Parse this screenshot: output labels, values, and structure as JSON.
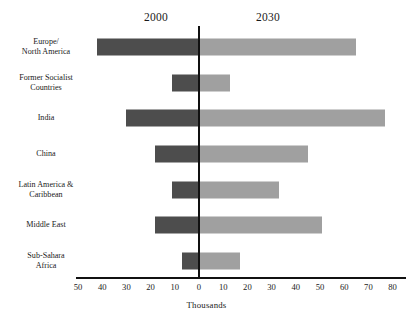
{
  "chart_data": {
    "type": "bar",
    "title": "",
    "subtitle": "",
    "orientation": "horizontal",
    "style": "diverging-back-to-back",
    "categories": [
      "Europe/\nNorth America",
      "Former Socialist\nCountries",
      "India",
      "China",
      "Latin America &\nCaribbean",
      "Middle East",
      "Sub-Sahara\nAfrica"
    ],
    "series": [
      {
        "name": "2000",
        "side": "left",
        "color": "#4d4d4d",
        "values": [
          42,
          11,
          30,
          18,
          11,
          18,
          7
        ]
      },
      {
        "name": "2030",
        "side": "right",
        "color": "#a0a0a0",
        "values": [
          65,
          13,
          77,
          45,
          33,
          51,
          17
        ]
      }
    ],
    "xlabel": "Thousands",
    "ylabel": "",
    "left_axis_max": 50,
    "right_axis_max": 80,
    "xticks_left": [
      50,
      40,
      30,
      20,
      10
    ],
    "xticks_zero": [
      0
    ],
    "xticks_right": [
      10,
      20,
      30,
      40,
      50,
      60,
      70,
      80
    ],
    "xtick_labels": [
      "50",
      "40",
      "30",
      "20",
      "10",
      "0",
      "10",
      "20",
      "30",
      "40",
      "50",
      "60",
      "70",
      "80"
    ],
    "grid": false,
    "legend": "column-headers",
    "legend_entries": [
      "2000",
      "2030"
    ]
  },
  "headers": {
    "left_era": "2000",
    "right_era": "2030"
  },
  "axis": {
    "x_title": "Thousands"
  },
  "colors": {
    "past_bar": "#4d4d4d",
    "future_bar": "#a0a0a0",
    "axis": "#111111",
    "text": "#1a1a1a",
    "background": "#ffffff"
  }
}
